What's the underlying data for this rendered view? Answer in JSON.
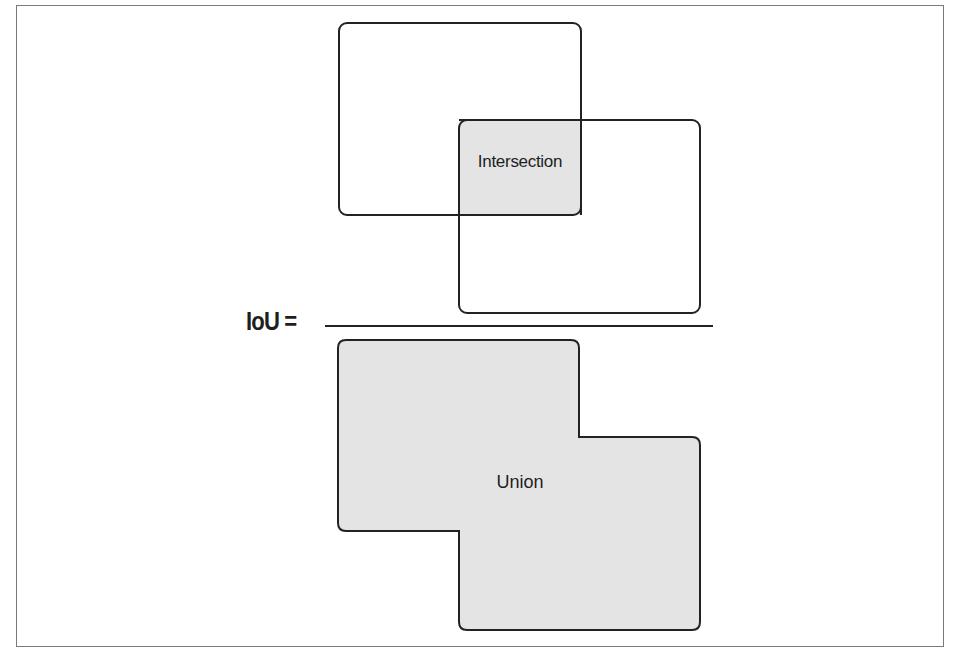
{
  "diagram": {
    "formula_label": "IoU =",
    "numerator": {
      "label": "Intersection",
      "description": "Two overlapping rounded rectangles with shaded overlap region"
    },
    "denominator": {
      "label": "Union",
      "description": "Combined shaded area of both rectangles"
    },
    "colors": {
      "stroke": "#222222",
      "fill": "#e4e4e4",
      "frame": "#7a7a7a",
      "background": "#ffffff"
    }
  }
}
